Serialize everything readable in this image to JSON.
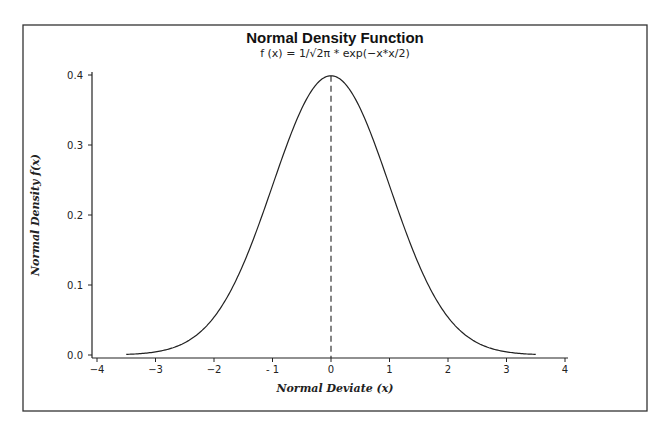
{
  "chart_data": {
    "type": "line",
    "title": "Normal Density Function",
    "subtitle": "f (x) = 1/√2π * exp(−x*x/2)",
    "xlabel": "Normal Deviate (x)",
    "ylabel": "Normal Density f(x)",
    "xlim": [
      -4,
      4
    ],
    "ylim": [
      0.0,
      0.4
    ],
    "xticks": [
      -4,
      -3,
      -2,
      -1,
      0,
      1,
      2,
      3,
      4
    ],
    "xtick_labels": [
      "−4",
      "−3",
      "−2",
      "- 1",
      "0",
      "1",
      "2",
      "3",
      "4"
    ],
    "yticks": [
      0.0,
      0.1,
      0.2,
      0.3,
      0.4
    ],
    "ytick_labels": [
      "0.0",
      "0.1",
      "0.2",
      "0.3",
      "0.4"
    ],
    "grid": false,
    "legend": null,
    "series": [
      {
        "name": "f(x)",
        "style": "solid",
        "x": [
          -3.5,
          -3.0,
          -2.5,
          -2.0,
          -1.5,
          -1.0,
          -0.5,
          0.0,
          0.5,
          1.0,
          1.5,
          2.0,
          2.5,
          3.0,
          3.5
        ],
        "y": [
          0.0009,
          0.0044,
          0.0175,
          0.054,
          0.1295,
          0.242,
          0.3521,
          0.3989,
          0.3521,
          0.242,
          0.1295,
          0.054,
          0.0175,
          0.0044,
          0.0009
        ]
      }
    ],
    "annotations": [
      {
        "type": "vline",
        "x": 0,
        "y_from": 0.0,
        "y_to": 0.3989,
        "style": "dashed"
      }
    ]
  }
}
